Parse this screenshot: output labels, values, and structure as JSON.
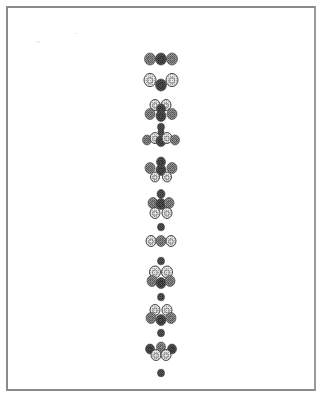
{
  "page": {
    "background": "#ffffff",
    "frame_color": "#8a8a8a"
  },
  "figure": {
    "palette": {
      "dark": "#4a4a4a",
      "mid": "#7a7a7a",
      "light": "#c8c8c8",
      "outline": "#3a3a3a"
    },
    "clusters": [
      {
        "name": "cluster-1",
        "beads": [
          {
            "x": 150,
            "y": 59,
            "r": 5.5,
            "tone": "mid"
          },
          {
            "x": 161,
            "y": 59,
            "r": 5.5,
            "tone": "dark"
          },
          {
            "x": 172,
            "y": 59,
            "r": 5.5,
            "tone": "mid"
          }
        ]
      },
      {
        "name": "cluster-2",
        "beads": [
          {
            "x": 150,
            "y": 80,
            "r": 6,
            "tone": "light"
          },
          {
            "x": 161,
            "y": 85,
            "r": 5.5,
            "tone": "dark"
          },
          {
            "x": 172,
            "y": 80,
            "r": 6,
            "tone": "light"
          }
        ]
      },
      {
        "name": "cluster-3",
        "beads": [
          {
            "x": 155,
            "y": 105,
            "r": 5,
            "tone": "light"
          },
          {
            "x": 166,
            "y": 105,
            "r": 5,
            "tone": "light"
          },
          {
            "x": 161,
            "y": 109,
            "r": 4.5,
            "tone": "dark"
          },
          {
            "x": 150,
            "y": 114,
            "r": 5,
            "tone": "mid"
          },
          {
            "x": 161,
            "y": 116,
            "r": 5,
            "tone": "dark"
          },
          {
            "x": 172,
            "y": 114,
            "r": 5,
            "tone": "mid"
          },
          {
            "x": 161,
            "y": 127,
            "r": 3.5,
            "tone": "dark"
          }
        ]
      },
      {
        "name": "cluster-4",
        "beads": [
          {
            "x": 147,
            "y": 140,
            "r": 4.5,
            "tone": "mid"
          },
          {
            "x": 155,
            "y": 138,
            "r": 5,
            "tone": "light"
          },
          {
            "x": 161,
            "y": 141,
            "r": 5,
            "tone": "dark"
          },
          {
            "x": 167,
            "y": 138,
            "r": 5,
            "tone": "light"
          },
          {
            "x": 175,
            "y": 140,
            "r": 4.5,
            "tone": "mid"
          },
          {
            "x": 161,
            "y": 132,
            "r": 3,
            "tone": "dark"
          }
        ]
      },
      {
        "name": "cluster-5",
        "beads": [
          {
            "x": 161,
            "y": 162,
            "r": 4.5,
            "tone": "dark"
          },
          {
            "x": 150,
            "y": 168,
            "r": 5,
            "tone": "mid"
          },
          {
            "x": 161,
            "y": 170,
            "r": 5,
            "tone": "dark"
          },
          {
            "x": 172,
            "y": 168,
            "r": 5,
            "tone": "mid"
          },
          {
            "x": 155,
            "y": 177,
            "r": 4.5,
            "tone": "light"
          },
          {
            "x": 167,
            "y": 177,
            "r": 4.5,
            "tone": "light"
          }
        ]
      },
      {
        "name": "cluster-6",
        "beads": [
          {
            "x": 161,
            "y": 194,
            "r": 4,
            "tone": "dark"
          },
          {
            "x": 153,
            "y": 203,
            "r": 5,
            "tone": "mid"
          },
          {
            "x": 161,
            "y": 204,
            "r": 5,
            "tone": "dark"
          },
          {
            "x": 169,
            "y": 203,
            "r": 5,
            "tone": "mid"
          },
          {
            "x": 155,
            "y": 213,
            "r": 5,
            "tone": "light"
          },
          {
            "x": 167,
            "y": 213,
            "r": 5,
            "tone": "light"
          }
        ]
      },
      {
        "name": "cluster-7",
        "beads": [
          {
            "x": 161,
            "y": 227,
            "r": 3.5,
            "tone": "dark"
          },
          {
            "x": 151,
            "y": 241,
            "r": 5,
            "tone": "light"
          },
          {
            "x": 161,
            "y": 241,
            "r": 5,
            "tone": "mid"
          },
          {
            "x": 171,
            "y": 241,
            "r": 5,
            "tone": "light"
          }
        ]
      },
      {
        "name": "cluster-8",
        "beads": [
          {
            "x": 161,
            "y": 261,
            "r": 3.5,
            "tone": "dark"
          },
          {
            "x": 155,
            "y": 272,
            "r": 5.5,
            "tone": "light"
          },
          {
            "x": 167,
            "y": 272,
            "r": 5.5,
            "tone": "light"
          },
          {
            "x": 152,
            "y": 281,
            "r": 5,
            "tone": "mid"
          },
          {
            "x": 161,
            "y": 283,
            "r": 5,
            "tone": "dark"
          },
          {
            "x": 170,
            "y": 281,
            "r": 5,
            "tone": "mid"
          }
        ]
      },
      {
        "name": "cluster-9",
        "beads": [
          {
            "x": 161,
            "y": 297,
            "r": 3.5,
            "tone": "dark"
          },
          {
            "x": 155,
            "y": 310,
            "r": 5,
            "tone": "light"
          },
          {
            "x": 167,
            "y": 310,
            "r": 5,
            "tone": "light"
          },
          {
            "x": 151,
            "y": 318,
            "r": 5,
            "tone": "mid"
          },
          {
            "x": 161,
            "y": 320,
            "r": 5,
            "tone": "dark"
          },
          {
            "x": 171,
            "y": 318,
            "r": 5,
            "tone": "mid"
          },
          {
            "x": 161,
            "y": 333,
            "r": 3.5,
            "tone": "dark"
          }
        ]
      },
      {
        "name": "cluster-10",
        "beads": [
          {
            "x": 150,
            "y": 349,
            "r": 4.5,
            "tone": "dark"
          },
          {
            "x": 161,
            "y": 347,
            "r": 4.5,
            "tone": "mid"
          },
          {
            "x": 172,
            "y": 349,
            "r": 4.5,
            "tone": "dark"
          },
          {
            "x": 156,
            "y": 355,
            "r": 5,
            "tone": "light"
          },
          {
            "x": 166,
            "y": 355,
            "r": 5,
            "tone": "light"
          },
          {
            "x": 161,
            "y": 373,
            "r": 3.5,
            "tone": "dark"
          }
        ]
      }
    ]
  }
}
